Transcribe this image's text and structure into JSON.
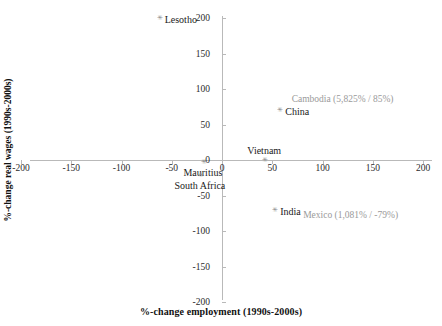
{
  "chart_data": {
    "type": "scatter",
    "title": "",
    "xlabel": "%-change employment  (1990s-2000s)",
    "ylabel": "%-change real wages (1990s-2000s)",
    "xlim": [
      -200,
      200
    ],
    "ylim": [
      -200,
      200
    ],
    "xticks": [
      "-200",
      "-150",
      "-100",
      "-50",
      "0",
      "50",
      "100",
      "150",
      "200"
    ],
    "xtick_values": [
      -200,
      -150,
      -100,
      -50,
      0,
      50,
      100,
      150,
      200
    ],
    "yticks": [
      "-200",
      "-150",
      "-100",
      "-50",
      "0",
      "50",
      "100",
      "150",
      "200"
    ],
    "ytick_values": [
      -200,
      -150,
      -100,
      -50,
      0,
      50,
      100,
      150,
      200
    ],
    "grid": false,
    "legend": "none",
    "points": [
      {
        "label": "Lesotho",
        "x": -63,
        "y": 197,
        "label_pos": "right"
      },
      {
        "label": "China",
        "x": 57,
        "y": 68,
        "label_pos": "right"
      },
      {
        "label": "Vietnam",
        "x": 42,
        "y": -3,
        "label_pos": "above"
      },
      {
        "label": "Mauritius",
        "x": -19,
        "y": -6,
        "label_pos": "below"
      },
      {
        "label": "South Africa",
        "x": -22,
        "y": -24,
        "label_pos": "below"
      },
      {
        "label": "India",
        "x": 52,
        "y": -73,
        "label_pos": "right"
      }
    ],
    "offchart_annotations": [
      {
        "text": "Cambodia (5,825% / 85%)",
        "x": 120,
        "y": 85
      },
      {
        "text": "Mexico (1,081% / -79%)",
        "x": 128,
        "y": -79
      }
    ],
    "colors": {
      "marker": "#8a8a8a",
      "axis": "#b9b9b9",
      "label_text": "#1a1a1a",
      "annotation_text": "#9a9a9a",
      "background": "#ffffff"
    }
  }
}
